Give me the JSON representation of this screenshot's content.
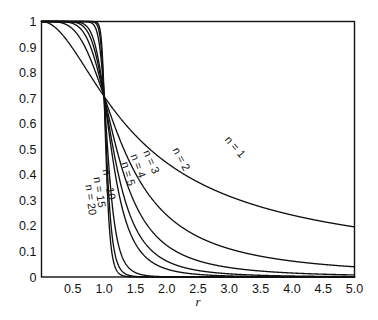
{
  "chart_data": {
    "type": "line",
    "title": "",
    "xlabel": "r",
    "ylabel": "",
    "xlim": [
      0,
      5
    ],
    "ylim": [
      0,
      1
    ],
    "grid": false,
    "legend": "inline-curve-labels",
    "x_ticks": [
      "0.5",
      "1.0",
      "1.5",
      "2.0",
      "2.5",
      "3.0",
      "3.5",
      "4.0",
      "4.5",
      "5.0"
    ],
    "x_tick_values": [
      0.5,
      1.0,
      1.5,
      2.0,
      2.5,
      3.0,
      3.5,
      4.0,
      4.5,
      5.0
    ],
    "y_ticks": [
      "0",
      "0.1",
      "0.2",
      "0.3",
      "0.4",
      "0.5",
      "0.6",
      "0.7",
      "0.8",
      "0.9",
      "1"
    ],
    "y_tick_values": [
      0,
      0.1,
      0.2,
      0.3,
      0.4,
      0.5,
      0.6,
      0.7,
      0.8,
      0.9,
      1
    ],
    "formula": "H(r) = 1 / sqrt(1 + r^(2n))",
    "series": [
      {
        "name": "n = 1",
        "n": 1,
        "label": "n = 1",
        "label_x": 3.05,
        "label_y": 0.5,
        "label_angle": 49,
        "values": [
          [
            0,
            1
          ],
          [
            0.25,
            0.9701
          ],
          [
            0.5,
            0.8944
          ],
          [
            0.75,
            0.8
          ],
          [
            1,
            0.7071
          ],
          [
            1.25,
            0.6247
          ],
          [
            1.5,
            0.5547
          ],
          [
            1.75,
            0.4961
          ],
          [
            2,
            0.4472
          ],
          [
            2.5,
            0.3714
          ],
          [
            3,
            0.3162
          ],
          [
            3.5,
            0.2747
          ],
          [
            4,
            0.2425
          ],
          [
            4.5,
            0.2169
          ],
          [
            5,
            0.1961
          ]
        ]
      },
      {
        "name": "n = 2",
        "n": 2,
        "label": "n = 2",
        "label_x": 2.18,
        "label_y": 0.455,
        "label_angle": 62,
        "values": [
          [
            0,
            1
          ],
          [
            0.25,
            0.9981
          ],
          [
            0.5,
            0.9701
          ],
          [
            0.75,
            0.8709
          ],
          [
            1,
            0.7071
          ],
          [
            1.25,
            0.5418
          ],
          [
            1.5,
            0.4061
          ],
          [
            1.75,
            0.3105
          ],
          [
            2,
            0.2425
          ],
          [
            2.5,
            0.1562
          ],
          [
            3,
            0.1104
          ],
          [
            3.5,
            0.0814
          ],
          [
            4,
            0.0624
          ],
          [
            4.5,
            0.0493
          ],
          [
            5,
            0.04
          ]
        ]
      },
      {
        "name": "n = 3",
        "n": 3,
        "label": "n = 3",
        "label_x": 1.7,
        "label_y": 0.445,
        "label_angle": 66,
        "values": [
          [
            0,
            1
          ],
          [
            0.25,
            0.9999
          ],
          [
            0.5,
            0.9988
          ],
          [
            0.75,
            0.9699
          ],
          [
            1,
            0.7071
          ],
          [
            1.25,
            0.3815
          ],
          [
            1.5,
            0.2256
          ],
          [
            1.75,
            0.146
          ],
          [
            2,
            0.124
          ],
          [
            2.5,
            0.0632
          ],
          [
            3,
            0.0366
          ],
          [
            3.5,
            0.0233
          ],
          [
            4,
            0.0156
          ],
          [
            4.5,
            0.011
          ],
          [
            5,
            0.008
          ]
        ]
      },
      {
        "name": "n = 4",
        "n": 4,
        "label": "n = 4",
        "label_x": 1.49,
        "label_y": 0.43,
        "label_angle": 70,
        "values": [
          [
            0,
            1
          ],
          [
            0.5,
            0.9999
          ],
          [
            0.75,
            0.9899
          ],
          [
            1,
            0.7071
          ],
          [
            1.25,
            0.2568
          ],
          [
            1.5,
            0.1229
          ],
          [
            1.75,
            0.0661
          ],
          [
            2,
            0.0625
          ],
          [
            2.5,
            0.0256
          ],
          [
            3,
            0.0123
          ],
          [
            3.5,
            0.0067
          ],
          [
            4,
            0.0039
          ],
          [
            4.5,
            0.0024
          ],
          [
            5,
            0.0016
          ]
        ]
      },
      {
        "name": "n = 5",
        "n": 5,
        "label": "n = 5",
        "label_x": 1.33,
        "label_y": 0.4,
        "label_angle": 73,
        "values": [
          [
            0,
            1
          ],
          [
            0.5,
            1.0
          ],
          [
            0.8,
            0.9951
          ],
          [
            1,
            0.7071
          ],
          [
            1.25,
            0.169
          ],
          [
            1.5,
            0.0671
          ],
          [
            1.75,
            0.0305
          ],
          [
            2,
            0.0313
          ],
          [
            2.5,
            0.0102
          ],
          [
            3,
            0.0041
          ],
          [
            3.5,
            0.0019
          ],
          [
            4,
            0.001
          ],
          [
            5,
            0.0003
          ]
        ]
      },
      {
        "name": "n = 10",
        "n": 10,
        "label": "n = 10",
        "label_x": 1.02,
        "label_y": 0.36,
        "label_angle": 79,
        "values": [
          [
            0,
            1
          ],
          [
            0.7,
            1.0
          ],
          [
            0.9,
            0.9823
          ],
          [
            1,
            0.7071
          ],
          [
            1.1,
            0.2464
          ],
          [
            1.25,
            0.0923
          ],
          [
            1.5,
            0.0173
          ],
          [
            1.75,
            0.0039
          ],
          [
            2,
            0.001
          ],
          [
            2.5,
            0.0001
          ],
          [
            3,
            2e-05
          ],
          [
            5,
            0
          ]
        ]
      },
      {
        "name": "n = 15",
        "n": 15,
        "label": "n = 15",
        "label_x": 0.87,
        "label_y": 0.33,
        "label_angle": 81,
        "values": [
          [
            0,
            1
          ],
          [
            0.8,
            1.0
          ],
          [
            0.93,
            0.9875
          ],
          [
            1,
            0.7071
          ],
          [
            1.07,
            0.2305
          ],
          [
            1.2,
            0.0568
          ],
          [
            1.4,
            0.008
          ],
          [
            1.6,
            0.0012
          ],
          [
            2,
            3e-05
          ],
          [
            3,
            0
          ],
          [
            5,
            0
          ]
        ]
      },
      {
        "name": "n = 20",
        "n": 20,
        "label": "n = 20",
        "label_x": 0.73,
        "label_y": 0.3,
        "label_angle": 83,
        "values": [
          [
            0,
            1
          ],
          [
            0.85,
            1.0
          ],
          [
            0.95,
            0.99
          ],
          [
            1,
            0.7071
          ],
          [
            1.05,
            0.2486
          ],
          [
            1.15,
            0.0526
          ],
          [
            1.3,
            0.0055
          ],
          [
            1.5,
            0.0004
          ],
          [
            2,
            1e-06
          ],
          [
            3,
            0
          ],
          [
            5,
            0
          ]
        ]
      }
    ]
  },
  "axes": {
    "x_axis_title": "r"
  }
}
